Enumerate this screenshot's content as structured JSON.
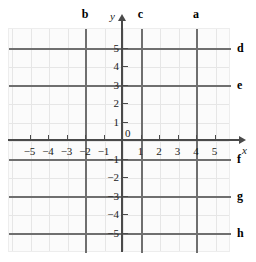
{
  "figure": {
    "type": "coordinate-grid",
    "background": "#ffffff",
    "plate_fill": "#fbfbfb",
    "grid_color": "#e6e6e6",
    "axis_color": "#4a4a4a",
    "highlight_color": "#6f6f6f"
  },
  "axes": {
    "x_name": "x",
    "y_name": "y",
    "origin_label": "0",
    "x_tick_labels": [
      "−5",
      "−4",
      "−3",
      "−2",
      "−1",
      "1",
      "2",
      "3",
      "4",
      "5"
    ],
    "y_tick_labels": [
      "5",
      "4",
      "3",
      "2",
      "1",
      "−1",
      "−2",
      "−3",
      "−4",
      "−5"
    ],
    "x_range": [
      -6,
      6
    ],
    "y_range": [
      -6,
      6
    ]
  },
  "lines": {
    "a": {
      "label": "a",
      "orientation": "vertical",
      "value": 4,
      "equation": "x = 4"
    },
    "b": {
      "label": "b",
      "orientation": "vertical",
      "value": -2,
      "equation": "x = -2"
    },
    "c": {
      "label": "c",
      "orientation": "vertical",
      "value": 1,
      "equation": "x = 1"
    },
    "d": {
      "label": "d",
      "orientation": "horizontal",
      "value": 5,
      "equation": "y = 5"
    },
    "e": {
      "label": "e",
      "orientation": "horizontal",
      "value": 3,
      "equation": "y = 3"
    },
    "f": {
      "label": "f",
      "orientation": "horizontal",
      "value": -1,
      "equation": "y = -1"
    },
    "g": {
      "label": "g",
      "orientation": "horizontal",
      "value": -3,
      "equation": "y = -3"
    },
    "h": {
      "label": "h",
      "orientation": "horizontal",
      "value": -5,
      "equation": "y = -5"
    }
  },
  "chart_data": {
    "type": "line",
    "title": "",
    "xlabel": "x",
    "ylabel": "y",
    "xlim": [
      -6,
      6
    ],
    "ylim": [
      -6,
      6
    ],
    "grid": true,
    "legend": "none",
    "x_ticks": [
      -5,
      -4,
      -3,
      -2,
      -1,
      0,
      1,
      2,
      3,
      4,
      5
    ],
    "y_ticks": [
      -5,
      -4,
      -3,
      -2,
      -1,
      0,
      1,
      2,
      3,
      4,
      5
    ],
    "series": [
      {
        "name": "a",
        "type": "vline",
        "value": 4
      },
      {
        "name": "b",
        "type": "vline",
        "value": -2
      },
      {
        "name": "c",
        "type": "vline",
        "value": 1
      },
      {
        "name": "d",
        "type": "hline",
        "value": 5
      },
      {
        "name": "e",
        "type": "hline",
        "value": 3
      },
      {
        "name": "f",
        "type": "hline",
        "value": -1
      },
      {
        "name": "g",
        "type": "hline",
        "value": -3
      },
      {
        "name": "h",
        "type": "hline",
        "value": -5
      }
    ]
  }
}
